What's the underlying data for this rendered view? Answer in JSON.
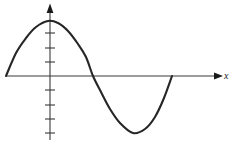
{
  "figure": {
    "title": "",
    "axis_label_x": "x",
    "axis_label_y": "",
    "stroke_color": "#262626",
    "axis_color": "#3a3a3a",
    "background_color": "#ffffff"
  },
  "chart_data": {
    "type": "line",
    "title": "",
    "xlabel": "x",
    "ylabel": "",
    "grid": false,
    "legend": false,
    "axis": {
      "x_axis_y_pixel": 76,
      "y_axis_x_pixel": 50,
      "x_axis_arrow_x_pixel": 220,
      "y_axis_arrow_y_pixel": 5,
      "y_axis_bottom_pixel": 140,
      "x_axis_left_pixel": 6
    },
    "y_ticks_above_axis_pixels": [
      33,
      48,
      62
    ],
    "y_ticks_below_axis_pixels": [
      90,
      105,
      119,
      133
    ],
    "tick_half_width_pixels": 5,
    "curve_key_points": {
      "start": [
        6,
        76
      ],
      "peak": [
        48,
        21
      ],
      "zero_crossing": [
        93,
        76
      ],
      "trough": [
        133,
        133
      ],
      "end": [
        172,
        76
      ]
    },
    "x": [
      6,
      16,
      26,
      36,
      48,
      58,
      68,
      78,
      86,
      93,
      101,
      110,
      120,
      133,
      145,
      155,
      164,
      172
    ],
    "y": [
      76,
      53,
      38,
      27,
      21,
      23,
      31,
      44,
      57,
      76,
      92,
      109,
      123,
      133,
      129,
      117,
      98,
      76
    ],
    "series": [
      {
        "name": "sine wave",
        "x": [
          6,
          16,
          26,
          36,
          48,
          58,
          68,
          78,
          86,
          93,
          101,
          110,
          120,
          133,
          145,
          155,
          164,
          172
        ],
        "y": [
          76,
          53,
          38,
          27,
          21,
          23,
          31,
          44,
          57,
          76,
          92,
          109,
          123,
          133,
          129,
          117,
          98,
          76
        ]
      }
    ]
  }
}
